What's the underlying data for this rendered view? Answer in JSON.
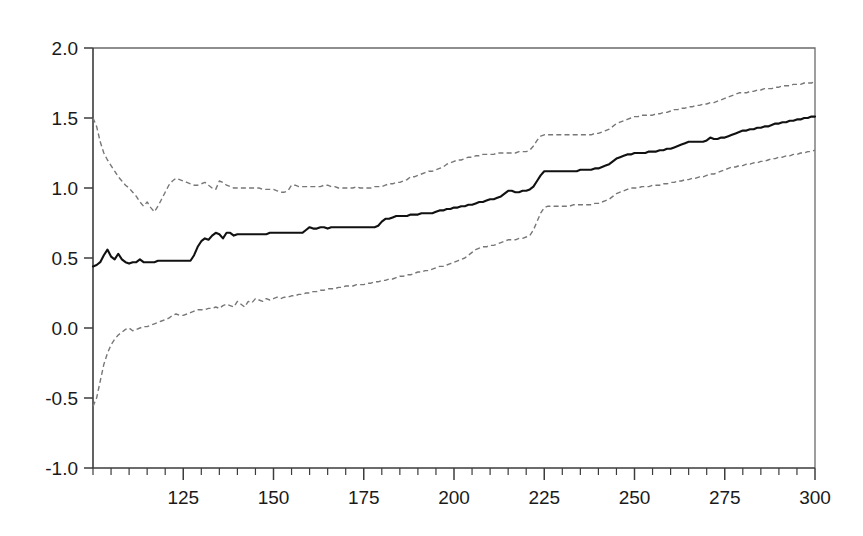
{
  "chart_data": {
    "type": "line",
    "title": "",
    "subtitle": "",
    "xlabel": "",
    "ylabel": "",
    "xlim": [
      100,
      300
    ],
    "ylim": [
      -1.0,
      2.0
    ],
    "grid": false,
    "legend_position": "none",
    "x_ticks": [
      125,
      150,
      175,
      200,
      225,
      250,
      275,
      300
    ],
    "x_tick_labels": [
      "125",
      "150",
      "175",
      "200",
      "225",
      "250",
      "275",
      "300"
    ],
    "x_minor_tick_step": 5,
    "y_ticks": [
      -1.0,
      -0.5,
      0.0,
      0.5,
      1.0,
      1.5,
      2.0
    ],
    "y_tick_labels": [
      "-1.0",
      "-0.5",
      "0.0",
      "0.5",
      "1.0",
      "1.5",
      "2.0"
    ],
    "colors": {
      "center_line": "#111111",
      "band_line": "#777777",
      "axis": "#3c3c3c",
      "frame": "#6a6a6a",
      "background": "#ffffff"
    },
    "x": [
      100,
      101,
      102,
      103,
      104,
      105,
      106,
      107,
      108,
      109,
      110,
      111,
      112,
      113,
      114,
      115,
      116,
      117,
      118,
      119,
      120,
      121,
      122,
      123,
      124,
      125,
      126,
      127,
      128,
      129,
      130,
      131,
      132,
      133,
      134,
      135,
      136,
      137,
      138,
      139,
      140,
      141,
      142,
      143,
      144,
      145,
      146,
      147,
      148,
      149,
      150,
      151,
      152,
      153,
      154,
      155,
      156,
      157,
      158,
      159,
      160,
      161,
      162,
      163,
      164,
      165,
      166,
      167,
      168,
      169,
      170,
      171,
      172,
      173,
      174,
      175,
      176,
      177,
      178,
      179,
      180,
      181,
      182,
      183,
      184,
      185,
      186,
      187,
      188,
      189,
      190,
      191,
      192,
      193,
      194,
      195,
      196,
      197,
      198,
      199,
      200,
      201,
      202,
      203,
      204,
      205,
      206,
      207,
      208,
      209,
      210,
      211,
      212,
      213,
      214,
      215,
      216,
      217,
      218,
      219,
      220,
      221,
      222,
      223,
      224,
      225,
      226,
      227,
      228,
      229,
      230,
      231,
      232,
      233,
      234,
      235,
      236,
      237,
      238,
      239,
      240,
      241,
      242,
      243,
      244,
      245,
      246,
      247,
      248,
      249,
      250,
      251,
      252,
      253,
      254,
      255,
      256,
      257,
      258,
      259,
      260,
      261,
      262,
      263,
      264,
      265,
      266,
      267,
      268,
      269,
      270,
      271,
      272,
      273,
      274,
      275,
      276,
      277,
      278,
      279,
      280,
      281,
      282,
      283,
      284,
      285,
      286,
      287,
      288,
      289,
      290,
      291,
      292,
      293,
      294,
      295,
      296,
      297,
      298,
      299,
      300
    ],
    "series": [
      {
        "name": "Upper confidence band",
        "style": "dashed",
        "values": [
          1.5,
          1.44,
          1.33,
          1.25,
          1.2,
          1.16,
          1.12,
          1.08,
          1.05,
          1.02,
          1.0,
          0.97,
          0.94,
          0.9,
          0.87,
          0.9,
          0.86,
          0.83,
          0.87,
          0.92,
          0.97,
          1.02,
          1.05,
          1.07,
          1.06,
          1.05,
          1.04,
          1.03,
          1.02,
          1.02,
          1.03,
          1.04,
          1.02,
          1.0,
          0.99,
          1.05,
          1.04,
          1.02,
          1.01,
          1.0,
          1.0,
          1.0,
          1.0,
          1.0,
          1.0,
          1.0,
          1.0,
          0.99,
          0.99,
          0.99,
          0.99,
          0.98,
          0.97,
          0.97,
          0.98,
          1.02,
          1.02,
          1.01,
          1.01,
          1.01,
          1.01,
          1.01,
          1.01,
          1.01,
          1.02,
          1.02,
          1.01,
          1.01,
          1.0,
          1.0,
          1.0,
          1.0,
          1.0,
          1.01,
          1.0,
          1.0,
          1.0,
          1.0,
          1.01,
          1.01,
          1.01,
          1.02,
          1.03,
          1.03,
          1.04,
          1.04,
          1.05,
          1.06,
          1.08,
          1.08,
          1.09,
          1.1,
          1.11,
          1.12,
          1.12,
          1.13,
          1.14,
          1.15,
          1.17,
          1.18,
          1.19,
          1.2,
          1.2,
          1.21,
          1.22,
          1.22,
          1.23,
          1.23,
          1.24,
          1.24,
          1.24,
          1.24,
          1.25,
          1.25,
          1.25,
          1.25,
          1.25,
          1.25,
          1.26,
          1.26,
          1.26,
          1.27,
          1.3,
          1.34,
          1.37,
          1.38,
          1.38,
          1.38,
          1.38,
          1.38,
          1.38,
          1.38,
          1.38,
          1.38,
          1.38,
          1.38,
          1.38,
          1.38,
          1.38,
          1.39,
          1.39,
          1.4,
          1.41,
          1.42,
          1.44,
          1.46,
          1.47,
          1.48,
          1.49,
          1.5,
          1.51,
          1.51,
          1.52,
          1.52,
          1.52,
          1.52,
          1.53,
          1.53,
          1.54,
          1.54,
          1.55,
          1.56,
          1.56,
          1.57,
          1.57,
          1.58,
          1.58,
          1.59,
          1.59,
          1.6,
          1.6,
          1.61,
          1.61,
          1.62,
          1.63,
          1.64,
          1.65,
          1.66,
          1.67,
          1.68,
          1.68,
          1.68,
          1.69,
          1.69,
          1.7,
          1.7,
          1.71,
          1.71,
          1.71,
          1.72,
          1.72,
          1.73,
          1.73,
          1.73,
          1.74,
          1.74,
          1.74,
          1.75,
          1.75,
          1.75,
          1.76
        ]
      },
      {
        "name": "Point estimate",
        "style": "solid",
        "values": [
          0.44,
          0.45,
          0.47,
          0.52,
          0.56,
          0.51,
          0.49,
          0.53,
          0.49,
          0.47,
          0.46,
          0.47,
          0.47,
          0.49,
          0.47,
          0.47,
          0.47,
          0.47,
          0.48,
          0.48,
          0.48,
          0.48,
          0.48,
          0.48,
          0.48,
          0.48,
          0.48,
          0.48,
          0.52,
          0.58,
          0.62,
          0.64,
          0.63,
          0.66,
          0.68,
          0.67,
          0.64,
          0.68,
          0.68,
          0.66,
          0.67,
          0.67,
          0.67,
          0.67,
          0.67,
          0.67,
          0.67,
          0.67,
          0.67,
          0.68,
          0.68,
          0.68,
          0.68,
          0.68,
          0.68,
          0.68,
          0.68,
          0.68,
          0.68,
          0.7,
          0.72,
          0.71,
          0.71,
          0.72,
          0.72,
          0.71,
          0.72,
          0.72,
          0.72,
          0.72,
          0.72,
          0.72,
          0.72,
          0.72,
          0.72,
          0.72,
          0.72,
          0.72,
          0.72,
          0.73,
          0.76,
          0.78,
          0.78,
          0.79,
          0.8,
          0.8,
          0.8,
          0.8,
          0.81,
          0.81,
          0.81,
          0.82,
          0.82,
          0.82,
          0.82,
          0.83,
          0.84,
          0.84,
          0.85,
          0.85,
          0.86,
          0.86,
          0.87,
          0.87,
          0.88,
          0.88,
          0.89,
          0.9,
          0.9,
          0.91,
          0.92,
          0.92,
          0.93,
          0.94,
          0.96,
          0.98,
          0.98,
          0.97,
          0.97,
          0.98,
          0.98,
          0.99,
          1.01,
          1.05,
          1.09,
          1.12,
          1.12,
          1.12,
          1.12,
          1.12,
          1.12,
          1.12,
          1.12,
          1.12,
          1.12,
          1.13,
          1.13,
          1.13,
          1.13,
          1.14,
          1.14,
          1.15,
          1.16,
          1.17,
          1.19,
          1.21,
          1.22,
          1.23,
          1.24,
          1.24,
          1.25,
          1.25,
          1.25,
          1.25,
          1.26,
          1.26,
          1.26,
          1.27,
          1.27,
          1.28,
          1.28,
          1.29,
          1.3,
          1.31,
          1.32,
          1.33,
          1.33,
          1.33,
          1.33,
          1.33,
          1.34,
          1.36,
          1.35,
          1.35,
          1.36,
          1.36,
          1.37,
          1.38,
          1.39,
          1.4,
          1.41,
          1.41,
          1.42,
          1.42,
          1.43,
          1.43,
          1.44,
          1.44,
          1.45,
          1.46,
          1.46,
          1.47,
          1.47,
          1.48,
          1.48,
          1.49,
          1.49,
          1.5,
          1.5,
          1.51,
          1.51
        ]
      },
      {
        "name": "Lower confidence band",
        "style": "dashed",
        "values": [
          -0.56,
          -0.5,
          -0.38,
          -0.26,
          -0.18,
          -0.12,
          -0.08,
          -0.05,
          -0.03,
          -0.01,
          0.0,
          -0.02,
          -0.01,
          0.0,
          0.01,
          0.01,
          0.02,
          0.03,
          0.04,
          0.05,
          0.06,
          0.07,
          0.09,
          0.1,
          0.09,
          0.09,
          0.1,
          0.11,
          0.12,
          0.13,
          0.13,
          0.13,
          0.14,
          0.14,
          0.15,
          0.14,
          0.16,
          0.17,
          0.16,
          0.15,
          0.19,
          0.17,
          0.15,
          0.19,
          0.18,
          0.21,
          0.2,
          0.19,
          0.21,
          0.2,
          0.21,
          0.22,
          0.21,
          0.22,
          0.22,
          0.23,
          0.23,
          0.24,
          0.24,
          0.25,
          0.25,
          0.26,
          0.26,
          0.27,
          0.27,
          0.28,
          0.28,
          0.28,
          0.29,
          0.29,
          0.3,
          0.3,
          0.3,
          0.31,
          0.31,
          0.31,
          0.32,
          0.32,
          0.33,
          0.33,
          0.34,
          0.34,
          0.35,
          0.35,
          0.36,
          0.37,
          0.37,
          0.38,
          0.38,
          0.39,
          0.4,
          0.4,
          0.41,
          0.41,
          0.42,
          0.43,
          0.44,
          0.44,
          0.45,
          0.46,
          0.47,
          0.48,
          0.49,
          0.5,
          0.52,
          0.54,
          0.56,
          0.57,
          0.58,
          0.58,
          0.59,
          0.59,
          0.6,
          0.61,
          0.62,
          0.63,
          0.63,
          0.63,
          0.64,
          0.64,
          0.65,
          0.66,
          0.7,
          0.76,
          0.82,
          0.86,
          0.87,
          0.87,
          0.87,
          0.87,
          0.87,
          0.87,
          0.87,
          0.88,
          0.88,
          0.88,
          0.88,
          0.88,
          0.88,
          0.89,
          0.89,
          0.9,
          0.91,
          0.92,
          0.94,
          0.96,
          0.97,
          0.98,
          0.99,
          1.0,
          1.0,
          1.0,
          1.01,
          1.01,
          1.01,
          1.02,
          1.02,
          1.02,
          1.03,
          1.03,
          1.04,
          1.04,
          1.05,
          1.05,
          1.06,
          1.06,
          1.07,
          1.07,
          1.08,
          1.08,
          1.09,
          1.1,
          1.1,
          1.11,
          1.12,
          1.13,
          1.14,
          1.15,
          1.15,
          1.16,
          1.16,
          1.17,
          1.17,
          1.18,
          1.18,
          1.19,
          1.19,
          1.2,
          1.21,
          1.21,
          1.22,
          1.22,
          1.23,
          1.23,
          1.24,
          1.24,
          1.25,
          1.25,
          1.26,
          1.26,
          1.27
        ]
      }
    ]
  }
}
